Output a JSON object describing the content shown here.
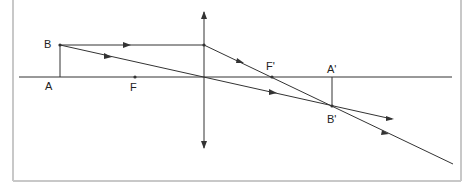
{
  "diagram": {
    "type": "thin converging lens ray diagram",
    "colors": {
      "line": "#333333",
      "border": "#c8c8c8",
      "background": "#ffffff"
    },
    "labels": {
      "A": "A",
      "B": "B",
      "F": "F",
      "F_prime": "F'",
      "A_prime": "A'",
      "B_prime": "B'"
    },
    "points": {
      "A": [
        60,
        77
      ],
      "B": [
        60,
        45
      ],
      "F": [
        135,
        77
      ],
      "lens_center": [
        204,
        77
      ],
      "lens_top_hit": [
        204,
        45
      ],
      "F_prime": [
        272,
        77
      ],
      "A_prime": [
        332,
        77
      ],
      "B_prime": [
        332,
        106
      ]
    }
  }
}
